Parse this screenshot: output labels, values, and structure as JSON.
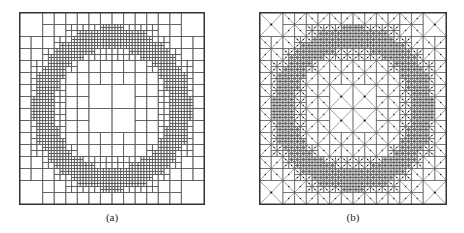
{
  "figure": {
    "panels": [
      {
        "id": "a",
        "caption": "(a)",
        "kind": "quadtree-mesh",
        "description": "Adaptive quadtree refinement around a circular ring",
        "box": {
          "x": 19,
          "y": 12,
          "w": 186,
          "h": 193
        },
        "max_depth": 6,
        "ring_radius": 0.37,
        "ring_width": 0.035
      },
      {
        "id": "b",
        "caption": "(b)",
        "kind": "triangular-mesh",
        "description": "Triangulated adaptive mesh with nodes around a circular ring",
        "box": {
          "x": 259,
          "y": 12,
          "w": 188,
          "h": 193
        },
        "max_depth": 6,
        "ring_radius": 0.37,
        "ring_width": 0.035
      }
    ],
    "colors": {
      "line": "#555555",
      "border": "#333333",
      "node": "#111111",
      "background": "#ffffff"
    }
  }
}
